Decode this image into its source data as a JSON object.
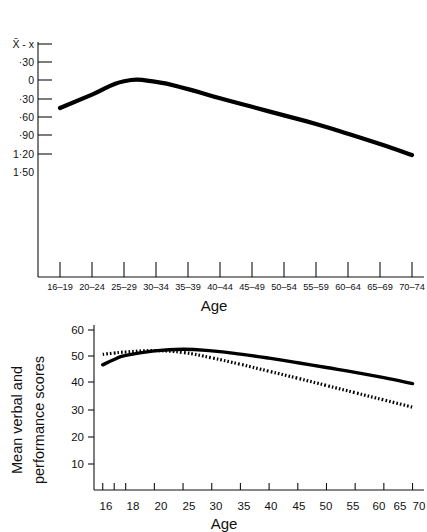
{
  "page": {
    "background_color": "#ffffff",
    "ink_color": "#000000"
  },
  "chart_data": [
    {
      "id": "top-chart",
      "type": "line",
      "title": "",
      "xlabel": "Age",
      "ylabel": "X̄ - x",
      "categories": [
        "16–19",
        "20–24",
        "25–29",
        "30–34",
        "35–39",
        "40–44",
        "45–49",
        "50–54",
        "55–59",
        "60–64",
        "65–69",
        "70–74"
      ],
      "ytick_labels": [
        "X̄ - x",
        "·30",
        "0",
        "·30",
        "·60",
        "·90",
        "1·20",
        "1·50"
      ],
      "ytick_values": [
        null,
        0.3,
        0,
        -0.3,
        -0.6,
        -0.9,
        -1.2,
        -1.5
      ],
      "ylim": [
        -1.5,
        0.3
      ],
      "grid": false,
      "legend": "none",
      "series": [
        {
          "name": "Mean difference",
          "style": "solid",
          "values": [
            -0.46,
            -0.24,
            -0.02,
            -0.03,
            -0.15,
            -0.3,
            -0.44,
            -0.58,
            -0.72,
            -0.88,
            -1.05,
            -1.23
          ]
        }
      ]
    },
    {
      "id": "bottom-chart",
      "type": "line",
      "title": "",
      "xlabel": "Age",
      "ylabel": "Mean verbal and performance scores",
      "xtick_labels": [
        "16",
        "18",
        "20",
        "25",
        "30",
        "35",
        "40",
        "45",
        "50",
        "55",
        "60",
        "65",
        "70"
      ],
      "xtick_values": [
        16,
        18,
        20,
        25,
        30,
        35,
        40,
        45,
        50,
        55,
        60,
        65,
        70
      ],
      "ytick_labels": [
        "10",
        "20",
        "30",
        "40",
        "50",
        "60"
      ],
      "ytick_values": [
        10,
        20,
        30,
        40,
        50,
        60
      ],
      "ylim": [
        0,
        63
      ],
      "xlim": [
        15,
        72
      ],
      "grid": false,
      "legend": "none",
      "series": [
        {
          "name": "Verbal",
          "style": "solid",
          "x": [
            16,
            18,
            20,
            25,
            30,
            35,
            40,
            45,
            50,
            55,
            60,
            65,
            70
          ],
          "values": [
            47.0,
            49.0,
            50.5,
            52.2,
            52.8,
            52.2,
            51.0,
            49.5,
            47.8,
            46.0,
            44.2,
            42.2,
            40.0
          ]
        },
        {
          "name": "Performance",
          "style": "dotted",
          "x": [
            16,
            18,
            20,
            25,
            30,
            35,
            40,
            45,
            50,
            55,
            60,
            65,
            70
          ],
          "values": [
            50.9,
            51.4,
            51.8,
            52.3,
            51.6,
            49.6,
            47.2,
            44.6,
            42.0,
            39.3,
            36.6,
            33.9,
            31.2
          ]
        }
      ]
    }
  ],
  "top_chart": {
    "y_axis_label": "X̄ - x",
    "x_axis_title": "Age",
    "y_ticks": [
      "X̄ - x",
      "·30",
      "0",
      "·30",
      "·60",
      "·90",
      "1·20",
      "1·50"
    ],
    "x_ticks": [
      "16–19",
      "20–24",
      "25–29",
      "30–34",
      "35–39",
      "40–44",
      "45–49",
      "50–54",
      "55–59",
      "60–64",
      "65–69",
      "70–74"
    ]
  },
  "bottom_chart": {
    "y_axis_label_line1": "Mean verbal and",
    "y_axis_label_line2": "performance scores",
    "x_axis_title": "Age",
    "y_ticks": [
      "60",
      "50",
      "40",
      "30",
      "20",
      "10"
    ],
    "x_ticks": [
      "16",
      "18",
      "20",
      "25",
      "30",
      "35",
      "40",
      "45",
      "50",
      "55",
      "60",
      "65",
      "70"
    ]
  }
}
